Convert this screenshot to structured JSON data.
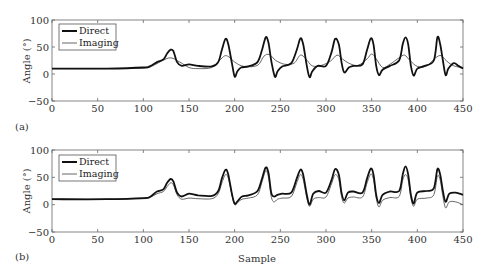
{
  "figure": {
    "panels": [
      {
        "label": "(a)"
      },
      {
        "label": "(b)"
      }
    ],
    "shared_xlabel": "Sample",
    "ylabel": "Angle (°)"
  },
  "colors": {
    "direct": "#111111",
    "imaging": "#555555",
    "axis": "#666666"
  },
  "chart_data": [
    {
      "type": "line",
      "panel": "(a)",
      "title": "",
      "xlabel": "",
      "ylabel": "Angle (°)",
      "xlim": [
        0,
        450
      ],
      "ylim": [
        -50,
        100
      ],
      "xticks": [
        0,
        50,
        100,
        150,
        200,
        250,
        300,
        350,
        400,
        450
      ],
      "yticks": [
        -50,
        0,
        50,
        100
      ],
      "grid": false,
      "legend": {
        "position": "upper left",
        "entries": [
          "Direct",
          "Imaging"
        ]
      },
      "series": [
        {
          "name": "Direct",
          "style": "thick",
          "x": [
            0,
            60,
            100,
            107,
            115,
            122,
            126,
            130,
            133,
            137,
            142,
            150,
            160,
            175,
            182,
            186,
            190,
            193,
            197,
            200,
            203,
            207,
            215,
            225,
            230,
            234,
            237,
            240,
            244,
            247,
            252,
            262,
            268,
            272,
            275,
            279,
            282,
            285,
            291,
            300,
            306,
            310,
            314,
            317,
            320,
            325,
            330,
            340,
            345,
            349,
            352,
            355,
            358,
            362,
            370,
            380,
            384,
            387,
            390,
            393,
            396,
            400,
            408,
            418,
            422,
            425,
            428,
            431,
            434,
            440,
            445,
            450
          ],
          "y": [
            10,
            10,
            12,
            14,
            22,
            27,
            38,
            45,
            42,
            22,
            15,
            18,
            15,
            14,
            22,
            45,
            65,
            55,
            20,
            -5,
            5,
            12,
            14,
            22,
            45,
            68,
            58,
            25,
            -5,
            5,
            14,
            20,
            45,
            66,
            55,
            15,
            -6,
            5,
            15,
            15,
            40,
            65,
            55,
            22,
            3,
            12,
            15,
            18,
            45,
            66,
            55,
            15,
            -2,
            8,
            15,
            25,
            55,
            68,
            55,
            15,
            -3,
            10,
            15,
            25,
            68,
            55,
            25,
            -2,
            10,
            20,
            15,
            10
          ]
        },
        {
          "name": "Imaging",
          "style": "thin",
          "x": [
            0,
            60,
            100,
            110,
            120,
            130,
            140,
            150,
            160,
            175,
            185,
            190,
            195,
            200,
            210,
            225,
            232,
            238,
            245,
            255,
            265,
            272,
            278,
            285,
            295,
            305,
            312,
            318,
            325,
            335,
            345,
            350,
            355,
            362,
            370,
            380,
            386,
            392,
            400,
            410,
            420,
            426,
            432,
            440,
            450
          ],
          "y": [
            10,
            10,
            11,
            15,
            24,
            30,
            22,
            12,
            10,
            12,
            28,
            34,
            30,
            22,
            14,
            16,
            33,
            36,
            25,
            18,
            20,
            35,
            28,
            15,
            16,
            24,
            35,
            28,
            20,
            16,
            28,
            37,
            28,
            12,
            18,
            30,
            35,
            25,
            14,
            15,
            30,
            34,
            24,
            15,
            12
          ]
        }
      ]
    },
    {
      "type": "line",
      "panel": "(b)",
      "title": "",
      "xlabel": "Sample",
      "ylabel": "Angle (°)",
      "xlim": [
        0,
        450
      ],
      "ylim": [
        -50,
        100
      ],
      "xticks": [
        0,
        50,
        100,
        150,
        200,
        250,
        300,
        350,
        400,
        450
      ],
      "yticks": [
        -50,
        0,
        50,
        100
      ],
      "grid": false,
      "legend": {
        "position": "upper left",
        "entries": [
          "Direct",
          "Imaging"
        ]
      },
      "series": [
        {
          "name": "Direct",
          "style": "thick",
          "x": [
            0,
            60,
            100,
            107,
            115,
            122,
            126,
            130,
            133,
            137,
            142,
            150,
            160,
            175,
            182,
            186,
            190,
            193,
            197,
            200,
            204,
            208,
            215,
            225,
            230,
            234,
            237,
            240,
            243,
            247,
            252,
            262,
            268,
            272,
            275,
            279,
            282,
            286,
            292,
            300,
            306,
            310,
            314,
            317,
            320,
            324,
            330,
            340,
            345,
            349,
            352,
            355,
            358,
            362,
            370,
            380,
            384,
            387,
            390,
            393,
            396,
            400,
            410,
            418,
            422,
            425,
            428,
            431,
            435,
            442,
            450
          ],
          "y": [
            10,
            10,
            12,
            14,
            24,
            28,
            40,
            47,
            42,
            22,
            15,
            20,
            17,
            16,
            25,
            48,
            64,
            55,
            20,
            2,
            8,
            15,
            17,
            25,
            48,
            68,
            58,
            22,
            15,
            18,
            20,
            22,
            48,
            64,
            55,
            18,
            0,
            20,
            25,
            22,
            45,
            65,
            55,
            22,
            8,
            22,
            24,
            22,
            48,
            66,
            55,
            18,
            3,
            18,
            24,
            25,
            55,
            70,
            55,
            18,
            2,
            22,
            25,
            30,
            65,
            55,
            25,
            5,
            20,
            22,
            18
          ]
        },
        {
          "name": "Imaging",
          "style": "thin",
          "x": [
            0,
            60,
            100,
            107,
            115,
            122,
            126,
            130,
            133,
            137,
            142,
            150,
            160,
            175,
            182,
            186,
            190,
            193,
            197,
            200,
            204,
            208,
            215,
            225,
            230,
            234,
            237,
            240,
            243,
            247,
            252,
            262,
            268,
            272,
            275,
            279,
            282,
            286,
            292,
            300,
            306,
            310,
            314,
            317,
            320,
            324,
            330,
            340,
            345,
            349,
            352,
            355,
            358,
            362,
            370,
            380,
            384,
            387,
            390,
            393,
            396,
            400,
            410,
            418,
            422,
            425,
            428,
            431,
            435,
            442,
            450
          ],
          "y": [
            10,
            10,
            11,
            13,
            20,
            24,
            33,
            40,
            36,
            18,
            10,
            12,
            11,
            11,
            20,
            40,
            55,
            48,
            18,
            0,
            5,
            10,
            12,
            18,
            42,
            62,
            50,
            15,
            5,
            10,
            12,
            15,
            40,
            55,
            46,
            12,
            -3,
            10,
            13,
            14,
            38,
            55,
            46,
            15,
            3,
            12,
            14,
            14,
            40,
            56,
            46,
            12,
            -4,
            8,
            13,
            15,
            45,
            55,
            45,
            12,
            -3,
            10,
            12,
            18,
            52,
            45,
            15,
            -6,
            5,
            5,
            0
          ]
        }
      ]
    }
  ]
}
